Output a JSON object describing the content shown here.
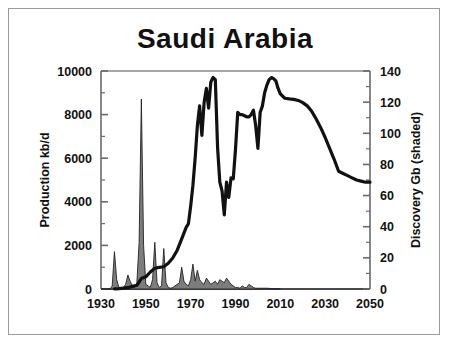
{
  "figure": {
    "title": "Saudi Arabia",
    "border_color": "#9a9a9a",
    "background": "#ffffff"
  },
  "chart_data": {
    "type": "line",
    "title": "Saudi Arabia",
    "xlabel": "",
    "ylabel": "Production kb/d",
    "y2label": "Discovery Gb (shaded)",
    "xlim": [
      1930,
      2050
    ],
    "ylim": [
      0,
      10000
    ],
    "y2lim": [
      0,
      140
    ],
    "grid": false,
    "legend": "none",
    "xticks": [
      1930,
      1950,
      1970,
      1990,
      2010,
      2030,
      2050
    ],
    "xtick_labels": [
      "1930",
      "1950",
      "1970",
      "1990",
      "2010",
      "2030",
      "2050"
    ],
    "yticks": [
      0,
      2000,
      4000,
      6000,
      8000,
      10000
    ],
    "ytick_labels": [
      "0",
      "2000",
      "4000",
      "6000",
      "8000",
      "10000"
    ],
    "y2ticks": [
      0,
      20,
      40,
      60,
      80,
      100,
      120,
      140
    ],
    "y2tick_labels": [
      "0",
      "20",
      "40",
      "60",
      "80",
      "100",
      "120",
      "140"
    ],
    "yminor_step": 1000,
    "y2minor_step": 10,
    "series": [
      {
        "name": "Production kb/d",
        "type": "line",
        "axis": "left",
        "color": "#111111",
        "linewidth": 3.2,
        "x": [
          1936,
          1938,
          1940,
          1942,
          1944,
          1946,
          1948,
          1950,
          1952,
          1954,
          1956,
          1958,
          1960,
          1962,
          1964,
          1966,
          1968,
          1969,
          1970,
          1971,
          1972,
          1973,
          1974,
          1975,
          1976,
          1977,
          1978,
          1979,
          1980,
          1981,
          1982,
          1983,
          1984,
          1985,
          1986,
          1987,
          1988,
          1989,
          1990,
          1991,
          1992,
          1993,
          1994,
          1995,
          1996,
          1997,
          1998,
          1999,
          2000,
          2001,
          2002,
          2003,
          2004,
          2005,
          2006,
          2007,
          2008,
          2009,
          2010,
          2012,
          2014,
          2016,
          2018,
          2020,
          2022,
          2024,
          2026,
          2028,
          2030,
          2032,
          2034,
          2036,
          2038,
          2040,
          2042,
          2044,
          2046,
          2048,
          2050
        ],
        "values": [
          10,
          20,
          40,
          60,
          120,
          170,
          480,
          560,
          780,
          950,
          990,
          1020,
          1180,
          1420,
          1780,
          2300,
          2830,
          3000,
          3800,
          4750,
          6000,
          7500,
          8400,
          7050,
          8550,
          9200,
          8300,
          9500,
          9700,
          9600,
          6500,
          4900,
          4500,
          3400,
          4900,
          4200,
          5100,
          5050,
          6400,
          8100,
          8000,
          8000,
          7950,
          7900,
          7900,
          8000,
          8200,
          7500,
          6450,
          8100,
          8400,
          9000,
          9350,
          9600,
          9700,
          9650,
          9550,
          9200,
          8950,
          8750,
          8720,
          8700,
          8650,
          8550,
          8400,
          8150,
          7800,
          7400,
          6950,
          6450,
          5950,
          5400,
          5300,
          5200,
          5100,
          5000,
          4950,
          4900,
          4900
        ]
      },
      {
        "name": "Discovery Gb (shaded)",
        "type": "area",
        "axis": "right",
        "fill_color": "#7d7d7d",
        "edge_color": "#222222",
        "x": [
          1930,
          1932,
          1934,
          1935,
          1936,
          1937,
          1938,
          1939,
          1940,
          1941,
          1942,
          1943,
          1944,
          1945,
          1946,
          1947,
          1948,
          1949,
          1950,
          1951,
          1952,
          1953,
          1954,
          1955,
          1956,
          1957,
          1958,
          1959,
          1960,
          1961,
          1962,
          1963,
          1964,
          1965,
          1966,
          1967,
          1968,
          1969,
          1970,
          1971,
          1972,
          1973,
          1974,
          1975,
          1976,
          1977,
          1978,
          1979,
          1980,
          1981,
          1982,
          1983,
          1984,
          1985,
          1986,
          1987,
          1988,
          1989,
          1990,
          1991,
          1992,
          1993,
          1994,
          1995,
          1996,
          1997,
          1998,
          1999,
          2000,
          2002,
          2004,
          2006,
          2008,
          2010
        ],
        "values": [
          0,
          0,
          0,
          2,
          24,
          6,
          1,
          0.5,
          1,
          3,
          9,
          5,
          2,
          1,
          4,
          30,
          122,
          28,
          3,
          2,
          1,
          6,
          30,
          4,
          1,
          2,
          26,
          4,
          1,
          0.5,
          1,
          2,
          3,
          4,
          14,
          5,
          3,
          2,
          6,
          16,
          5,
          12,
          6,
          4,
          3,
          7,
          5,
          3,
          4,
          5,
          3,
          6,
          5,
          4,
          7,
          5,
          3,
          2,
          1,
          1,
          0.5,
          2,
          1,
          1,
          3,
          2,
          1,
          0.5,
          0.5,
          0.5,
          0.5,
          0.3,
          0.2,
          0
        ]
      }
    ]
  }
}
